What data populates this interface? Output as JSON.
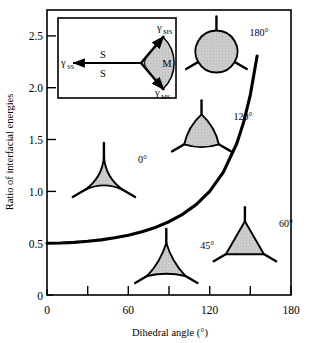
{
  "chart_data": {
    "type": "line",
    "title": "",
    "xlabel": "Dihedral angle (°)",
    "ylabel": "Ratio of interfacial energies",
    "xlim": [
      0,
      180
    ],
    "ylim": [
      0,
      2.75
    ],
    "grid": false,
    "legend": "none",
    "x_ticks": [
      0,
      30,
      60,
      90,
      120,
      150,
      180
    ],
    "x_tick_labels": [
      "0",
      "",
      "60",
      "",
      "120",
      "",
      "180"
    ],
    "y_ticks": [
      0,
      0.5,
      1.0,
      1.5,
      2.0,
      2.5
    ],
    "y_tick_labels": [
      "0",
      "0.5",
      "1.0",
      "1.5",
      "2.0",
      "2.5"
    ],
    "series": [
      {
        "name": "gamma_SS / gamma_MS = 2 cos(theta/2) relation",
        "x": [
          0,
          10,
          20,
          30,
          40,
          50,
          60,
          70,
          80,
          90,
          100,
          110,
          120,
          130,
          140,
          145,
          150,
          155,
          160
        ],
        "y": [
          0.5,
          0.502,
          0.508,
          0.518,
          0.532,
          0.552,
          0.577,
          0.61,
          0.652,
          0.707,
          0.779,
          0.872,
          1.0,
          1.183,
          1.462,
          1.664,
          1.932,
          2.306,
          2.88
        ]
      }
    ],
    "annotations": [
      {
        "label": "0°",
        "x": 42,
        "y": 1.12,
        "shape": "concave-triangle",
        "concavity": 0.82
      },
      {
        "label": "45°",
        "x": 88,
        "y": 0.29,
        "shape": "concave-triangle",
        "concavity": 0.4
      },
      {
        "label": "60°",
        "x": 146,
        "y": 0.5,
        "shape": "triangle",
        "concavity": 0.0
      },
      {
        "label": "120°",
        "x": 114,
        "y": 1.55,
        "shape": "rounded-triangle",
        "concavity": -0.55
      },
      {
        "label": "180°",
        "x": 125,
        "y": 2.35,
        "shape": "circle",
        "concavity": -1.0
      }
    ]
  },
  "inset": {
    "gamma_ss_label": "γ",
    "gamma_ss_sub": "SS",
    "gamma_ms_top_label": "γ",
    "gamma_ms_top_sub": "MS",
    "gamma_ms_bot_label": "γ",
    "gamma_ms_bot_sub": "MS",
    "s_upper": "S",
    "s_lower": "S",
    "m_label": "M"
  },
  "axes": {
    "x_title": "Dihedral angle (°)",
    "y_title": "Ratio of interfacial energies"
  },
  "colors": {
    "line": "#000000",
    "fill": "#c9c9c9",
    "stroke": "#000000",
    "background": "#ffffff"
  }
}
